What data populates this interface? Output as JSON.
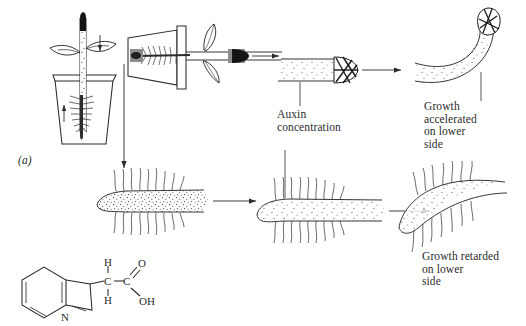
{
  "figure": {
    "panel_label": "(a)"
  },
  "labels": {
    "auxin_concentration": "Auxin\nconcentration",
    "growth_accelerated": "Growth\naccelerated\non lower\nside",
    "growth_retarded": "Growth retarded\non lower\nside"
  },
  "chemical": {
    "name": "indole-3-acetic-acid",
    "atoms": [
      {
        "id": "h-top",
        "text": "H"
      },
      {
        "id": "h-bottom",
        "text": "H"
      },
      {
        "id": "c-alpha",
        "text": "C"
      },
      {
        "id": "c-carboxyl",
        "text": "C"
      },
      {
        "id": "o-double",
        "text": "O"
      },
      {
        "id": "oh",
        "text": "OH"
      },
      {
        "id": "n-ring",
        "text": "N"
      }
    ]
  },
  "scene": {
    "upright_plant": {
      "name": "upright-potted-seedling",
      "gravity_arrow": "down-arrow",
      "root_arrow": "up-arrow"
    },
    "horizontal_plant": {
      "name": "horizontal-potted-seedling"
    },
    "shoot_tip_straight": {
      "name": "straight-shoot-tip"
    },
    "shoot_tip_curved": {
      "name": "upward-curved-shoot-tip"
    },
    "root_tip_even": {
      "name": "evenly-stippled-root-tip"
    },
    "root_tip_gradient": {
      "name": "gradient-stippled-root-tip"
    },
    "root_tip_curved": {
      "name": "downward-curved-root-tip"
    }
  },
  "colors": {
    "ink": "#2b2b2b",
    "stipple": "#3a3a3a",
    "block_fill": "#8d8d8d",
    "tip_dark": "#1a1a1a",
    "background": "#ffffff"
  }
}
